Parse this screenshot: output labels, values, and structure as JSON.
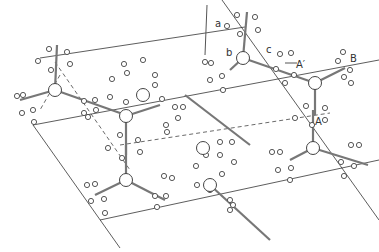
{
  "figure": {
    "type": "crystal-packing-diagram",
    "labels": {
      "a": "a",
      "b": "b",
      "c": "c",
      "A_prime": "A′",
      "A": "A",
      "B": "B"
    },
    "colors": {
      "line": "#333333",
      "bond": "#777777",
      "atom_fill": "#ffffff"
    }
  }
}
